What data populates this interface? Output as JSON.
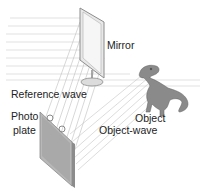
{
  "diagram": {
    "labels": {
      "mirror": "Mirror",
      "reference_wave": "Reference wave",
      "object": "Object",
      "object_wave": "Object-wave",
      "photo_plate_line1": "Photo",
      "photo_plate_line2": "plate"
    },
    "components": [
      {
        "name": "incident-beam",
        "description": "parallel horizontal light lines entering from left"
      },
      {
        "name": "mirror",
        "description": "tilted framed mirror on round stand"
      },
      {
        "name": "object",
        "description": "toy T-rex dinosaur figure"
      },
      {
        "name": "photo-plate",
        "description": "tilted gray photographic plate with clips"
      }
    ],
    "colors": {
      "beam": "#c8c8c8",
      "frame": "#9a9a9a",
      "plate": "#b4b4b4",
      "text": "#222222"
    }
  }
}
